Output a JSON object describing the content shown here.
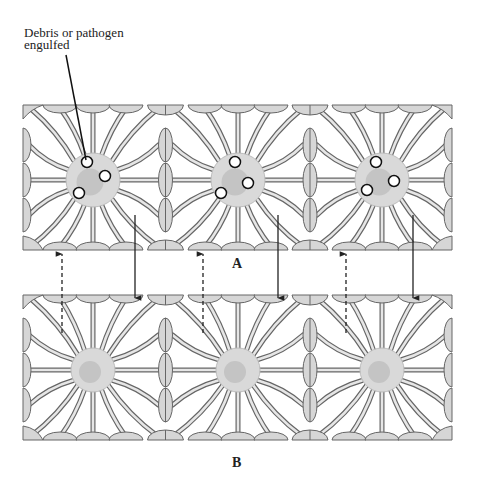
{
  "figure": {
    "callout": {
      "line1": "Debris or pathogen",
      "line2": "engulfed"
    },
    "panels": [
      {
        "id": "A",
        "label": "A",
        "state": "phagocytic cells with engulfed particles",
        "cell_centers_x": [
          93,
          238,
          382
        ],
        "center_y": 180,
        "cell_radius": 27,
        "particles": [
          [
            [
              -6,
              -18
            ],
            [
              12,
              -4
            ],
            [
              -14,
              13
            ]
          ],
          [
            [
              -3,
              -18
            ],
            [
              10,
              3
            ],
            [
              -17,
              13
            ]
          ],
          [
            [
              -6,
              -18
            ],
            [
              12,
              1
            ],
            [
              -15,
              10
            ]
          ]
        ]
      },
      {
        "id": "B",
        "label": "B",
        "state": "resting cells",
        "cell_centers_x": [
          93,
          238,
          382
        ],
        "center_y": 370,
        "cell_radius": 22
      }
    ],
    "arrows": {
      "dashed_up_x": [
        62,
        203,
        346
      ],
      "solid_down_x": [
        135,
        278,
        413
      ]
    },
    "colors": {
      "cell_fill": "#d9d9d9",
      "nucleus_fill": "#c4c4c4",
      "process_outline": "#666666",
      "process_fill": "#e6e6e6",
      "endfoot_fill": "#d6d6d6",
      "arrow": "#222222",
      "particle_fill": "#ffffff",
      "particle_stroke": "#111111"
    }
  }
}
